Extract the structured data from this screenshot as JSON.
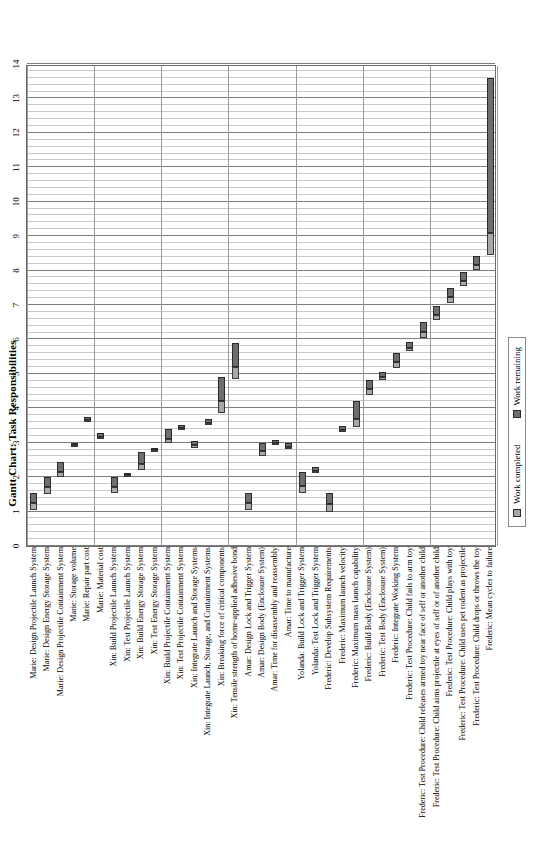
{
  "chart_data": {
    "type": "bar",
    "title": "Gantt Chart: Task Responsibilities",
    "xlabel": "",
    "ylabel": "",
    "xlim": [
      0,
      14
    ],
    "xticks": [
      0,
      1,
      2,
      3,
      4,
      5,
      6,
      7,
      8,
      9,
      10,
      11,
      12,
      13,
      14
    ],
    "grid": true,
    "legend_position": "bottom",
    "legend": [
      "Work completed",
      "Work remaining"
    ],
    "colors": {
      "work_completed": "#a9a9a9",
      "work_remaining": "#6e6e6e",
      "gridline_major": "#7d7d7d",
      "gridline_minor": "#c9c9c9",
      "axis": "#6a6a6a"
    },
    "categories": [
      "Marie: Design Projectile Launch System",
      "Marie: Design Energy Storage System",
      "Marie: Design Projectile Containment System",
      "Marie: Storage volume",
      "Marie: Repair part cost",
      "Marie: Material cost",
      "Xin: Build Projectile Launch System",
      "Xin: Test Projectile Launch System",
      "Xin: Build Energy Storage System",
      "Xin: Test Energy Storage System",
      "Xin: Build Projectile Containment System",
      "Xin: Test Projectile Containment System",
      "Xin: Integrate Launch and Storage Systems",
      "Xin: Integrate Launch, Storage, and Containment Systems",
      "Xin: Breaking force of critical components",
      "Xin: Tensile strength of home-applied adhesive bond",
      "Amar: Design Lock and Trigger System",
      "Amar: Design Body (Enclosure System)",
      "Amar: Time for disassembly and reassembly",
      "Amar: Time to manufacture",
      "Yolanda: Build Lock and Trigger System",
      "Yolanda: Test Lock and Trigger System",
      "Frederic: Develop Subsystem Requirements",
      "Frederic: Maximum launch velocity",
      "Frederic: Maximum mass launch capability",
      "Frederic: Build Body (Enclosure System)",
      "Frederic: Test Body (Enclosure System)",
      "Frederic: Integrate Working System",
      "Frederic: Test Procedure: Child fails to arm toy",
      "Frederic: Test Procedure: Child releases armed toy near face of self or another child",
      "Frederic: Test Procedure: Child aims projectile at eyes of self or of another child",
      "Frederic: Test Procedure: Child plays with toy",
      "Frederic: Test Procedure: Child uses pet rodent as projectile",
      "Frederic: Test Procedure: Child drops or throws the toy",
      "Frederic: Mean cycles to failure"
    ],
    "tasks": [
      {
        "label": "Marie: Design Projectile Launch System",
        "start": 1.05,
        "completed_end": 1.25,
        "end": 1.55
      },
      {
        "label": "Marie: Design Energy Storage System",
        "start": 1.5,
        "completed_end": 1.7,
        "end": 2.0
      },
      {
        "label": "Marie: Design Projectile Containment System",
        "start": 2.0,
        "completed_end": 2.15,
        "end": 2.45
      },
      {
        "label": "Marie: Storage volume",
        "start": 2.88,
        "completed_end": 2.93,
        "end": 3.0
      },
      {
        "label": "Marie: Repair part cost",
        "start": 3.6,
        "completed_end": 3.66,
        "end": 3.75
      },
      {
        "label": "Marie: Material cost",
        "start": 3.1,
        "completed_end": 3.16,
        "end": 3.27
      },
      {
        "label": "Xin: Build Projectile Launch System",
        "start": 1.55,
        "completed_end": 1.72,
        "end": 2.0
      },
      {
        "label": "Xin: Test Projectile Launch System",
        "start": 2.0,
        "completed_end": 2.05,
        "end": 2.13
      },
      {
        "label": "Xin: Build Energy Storage System",
        "start": 2.2,
        "completed_end": 2.38,
        "end": 2.72
      },
      {
        "label": "Xin: Test Energy Storage System",
        "start": 2.73,
        "completed_end": 2.78,
        "end": 2.86
      },
      {
        "label": "Xin: Build Projectile Containment System",
        "start": 3.0,
        "completed_end": 3.12,
        "end": 3.4
      },
      {
        "label": "Xin: Test Projectile Containment System",
        "start": 3.38,
        "completed_end": 3.43,
        "end": 3.51
      },
      {
        "label": "Xin: Integrate Launch and Storage Systems",
        "start": 2.85,
        "completed_end": 2.92,
        "end": 3.05
      },
      {
        "label": "Xin: Integrate Launch, Storage, and Containment Systems",
        "start": 3.5,
        "completed_end": 3.56,
        "end": 3.68
      },
      {
        "label": "Xin: Breaking force of critical components",
        "start": 3.85,
        "completed_end": 4.2,
        "end": 4.9
      },
      {
        "label": "Xin: Tensile strength of home-applied adhesive bond",
        "start": 4.85,
        "completed_end": 5.2,
        "end": 5.9
      },
      {
        "label": "Amar: Design Lock and Trigger System",
        "start": 1.05,
        "completed_end": 1.25,
        "end": 1.55
      },
      {
        "label": "Amar: Design Body (Enclosure System)",
        "start": 2.6,
        "completed_end": 2.75,
        "end": 3.0
      },
      {
        "label": "Amar: Time for disassembly and reassembly",
        "start": 2.92,
        "completed_end": 2.98,
        "end": 3.08
      },
      {
        "label": "Amar: Time to manufacture",
        "start": 2.82,
        "completed_end": 2.88,
        "end": 2.98
      },
      {
        "label": "Yolanda: Build Lock and Trigger System",
        "start": 1.55,
        "completed_end": 1.75,
        "end": 2.15
      },
      {
        "label": "Yolanda: Test Lock and Trigger System",
        "start": 2.12,
        "completed_end": 2.18,
        "end": 2.3
      },
      {
        "label": "Frederic: Develop Subsystem Requirements",
        "start": 1.0,
        "completed_end": 1.22,
        "end": 1.55
      },
      {
        "label": "Frederic: Maximum launch velocity",
        "start": 3.3,
        "completed_end": 3.38,
        "end": 3.5
      },
      {
        "label": "Frederic: Maximum mass launch capability",
        "start": 3.45,
        "completed_end": 3.7,
        "end": 4.2
      },
      {
        "label": "Frederic: Build Body (Enclosure System)",
        "start": 4.38,
        "completed_end": 4.55,
        "end": 4.82
      },
      {
        "label": "Frederic: Test Body (Enclosure System)",
        "start": 4.82,
        "completed_end": 4.9,
        "end": 5.05
      },
      {
        "label": "Frederic: Integrate Working System",
        "start": 5.18,
        "completed_end": 5.35,
        "end": 5.62
      },
      {
        "label": "Frederic: Test Procedure: Child fails to arm toy",
        "start": 5.65,
        "completed_end": 5.75,
        "end": 5.92
      },
      {
        "label": "Frederic: Test Procedure: Child releases armed toy near face of self or another child",
        "start": 6.05,
        "completed_end": 6.22,
        "end": 6.5
      },
      {
        "label": "Frederic: Test Procedure: Child aims projectile at eyes of self or of another child",
        "start": 6.55,
        "completed_end": 6.7,
        "end": 6.98
      },
      {
        "label": "Frederic: Test Procedure: Child plays with toy",
        "start": 7.05,
        "completed_end": 7.22,
        "end": 7.5
      },
      {
        "label": "Frederic: Test Procedure: Child uses pet rodent as projectile",
        "start": 7.55,
        "completed_end": 7.7,
        "end": 7.95
      },
      {
        "label": "Frederic: Test Procedure: Child drops or throws the toy",
        "start": 8.02,
        "completed_end": 8.15,
        "end": 8.42
      },
      {
        "label": "Frederic: Mean cycles to failure",
        "start": 8.45,
        "completed_end": 9.1,
        "end": 13.6
      }
    ]
  },
  "legend": {
    "completed_label": "Work completed",
    "remaining_label": "Work remaining"
  }
}
